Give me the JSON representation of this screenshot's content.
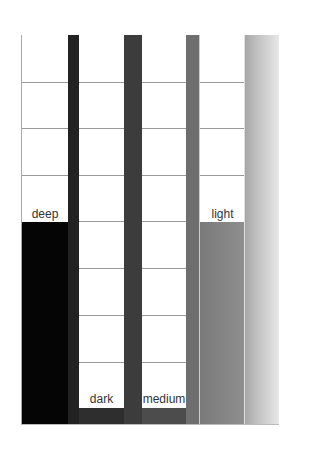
{
  "diagram": {
    "rows": 8,
    "columns": [
      {
        "id": "deep",
        "label": "deep",
        "fill_color": "#050505",
        "fill_top_row": 4,
        "strip_color": "#222222"
      },
      {
        "id": "dark",
        "label": "dark",
        "fill_color": "#2e2e2e",
        "fill_top_row": 8,
        "strip_color": "#3c3c3c"
      },
      {
        "id": "medium",
        "label": "medium",
        "fill_color": "#4c4c4c",
        "fill_top_row": 8,
        "strip_color": "#6e6e6e"
      },
      {
        "id": "light",
        "label": "light",
        "fill_color": "#858585",
        "fill_top_row": 4,
        "strip_color": null
      }
    ],
    "gradient": {
      "from": "#a6a6a6",
      "to": "#e8e8e8"
    }
  }
}
